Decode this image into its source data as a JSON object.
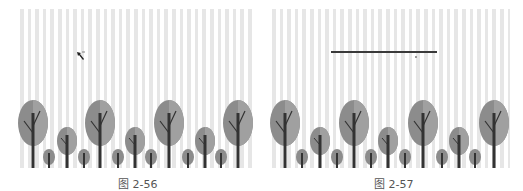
{
  "figures": [
    {
      "caption": "图 2-56",
      "overlay": "pen-cursor"
    },
    {
      "caption": "图 2-57",
      "overlay": "drawn-horizontal-line"
    }
  ],
  "colors": {
    "stripe": "#e6e6e6",
    "background": "#ffffff",
    "tree_canopy": "#8c8c8c",
    "tree_canopy_light": "#a3a3a3",
    "trunk": "#3b3b3b",
    "line": "#3a3a3a"
  }
}
